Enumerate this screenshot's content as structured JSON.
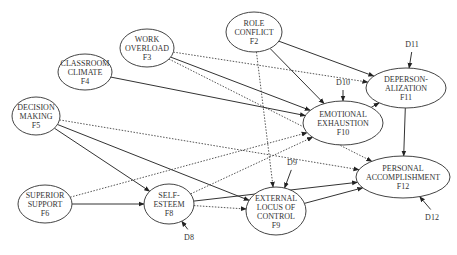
{
  "diagram": {
    "nodes": [
      {
        "id": "F2",
        "lines": [
          "ROLE",
          "CONFLICT",
          "F2"
        ],
        "cx": 254,
        "cy": 32,
        "rx": 28,
        "ry": 20
      },
      {
        "id": "F3",
        "lines": [
          "WORK",
          "OVERLOAD",
          "F3"
        ],
        "cx": 147,
        "cy": 48,
        "rx": 27,
        "ry": 19
      },
      {
        "id": "F4",
        "lines": [
          "CLASSROOM",
          "CLIMATE",
          "F4"
        ],
        "cx": 85,
        "cy": 72,
        "rx": 27,
        "ry": 18
      },
      {
        "id": "F5",
        "lines": [
          "DECISION",
          "MAKING",
          "F5"
        ],
        "cx": 36,
        "cy": 116,
        "rx": 24,
        "ry": 19
      },
      {
        "id": "F6",
        "lines": [
          "SUPERIOR",
          "SUPPORT",
          "F6"
        ],
        "cx": 45,
        "cy": 204,
        "rx": 27,
        "ry": 19
      },
      {
        "id": "F8",
        "lines": [
          "SELF-",
          "ESTEEM",
          "F8"
        ],
        "cx": 169,
        "cy": 204,
        "rx": 25,
        "ry": 20
      },
      {
        "id": "F9",
        "lines": [
          "EXTERNAL",
          "LOCUS OF",
          "CONTROL",
          "F9"
        ],
        "cx": 276,
        "cy": 211,
        "rx": 30,
        "ry": 24
      },
      {
        "id": "F10",
        "lines": [
          "EMOTIONAL",
          "EXHAUSTION",
          "F10"
        ],
        "cx": 343,
        "cy": 123,
        "rx": 40,
        "ry": 22
      },
      {
        "id": "F11",
        "lines": [
          "DEPERSON-",
          "ALIZATION",
          "F11"
        ],
        "cx": 406,
        "cy": 88,
        "rx": 40,
        "ry": 20
      },
      {
        "id": "F12",
        "lines": [
          "PERSONAL",
          "ACCOMPLISHMENT",
          "F12"
        ],
        "cx": 403,
        "cy": 177,
        "rx": 47,
        "ry": 21
      }
    ],
    "disturbances": [
      {
        "id": "D8",
        "label": "D8",
        "x": 189,
        "y": 240
      },
      {
        "id": "D9",
        "label": "D9",
        "x": 292,
        "y": 165
      },
      {
        "id": "D10",
        "label": "D10",
        "x": 343,
        "y": 85
      },
      {
        "id": "D11",
        "label": "D11",
        "x": 412,
        "y": 47
      },
      {
        "id": "D12",
        "label": "D12",
        "x": 432,
        "y": 220
      }
    ],
    "paths": [
      {
        "from": "F2",
        "to": "F11",
        "style": "solid"
      },
      {
        "from": "F2",
        "to": "F10",
        "style": "solid"
      },
      {
        "from": "F2",
        "to": "F9",
        "style": "dotted"
      },
      {
        "from": "F3",
        "to": "F11",
        "style": "dotted"
      },
      {
        "from": "F3",
        "to": "F10",
        "style": "solid"
      },
      {
        "from": "F3",
        "to": "F12",
        "style": "dotted"
      },
      {
        "from": "F4",
        "to": "F10",
        "style": "solid"
      },
      {
        "from": "F5",
        "to": "F12",
        "style": "dotted"
      },
      {
        "from": "F5",
        "to": "F8",
        "style": "solid"
      },
      {
        "from": "F5",
        "to": "F9",
        "style": "solid"
      },
      {
        "from": "F6",
        "to": "F8",
        "style": "solid"
      },
      {
        "from": "F6",
        "to": "F10",
        "style": "dotted"
      },
      {
        "from": "F8",
        "to": "F10",
        "style": "dotted"
      },
      {
        "from": "F8",
        "to": "F12",
        "style": "solid"
      },
      {
        "from": "F8",
        "to": "F9",
        "style": "dotted"
      },
      {
        "from": "F9",
        "to": "F12",
        "style": "solid"
      },
      {
        "from": "F10",
        "to": "F11",
        "style": "solid"
      },
      {
        "from": "F11",
        "to": "F12",
        "style": "solid"
      }
    ]
  }
}
